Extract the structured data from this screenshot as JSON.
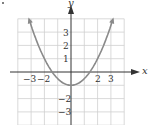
{
  "chart_data": {
    "type": "line",
    "title": "",
    "function": "y = x^2/2 - 1",
    "xlabel": "x",
    "ylabel": "y",
    "xlim": [
      -4,
      4
    ],
    "ylim": [
      -4,
      4
    ],
    "grid": true,
    "x_tick_labels": [
      "-3",
      "-2",
      "2",
      "3"
    ],
    "y_tick_labels": [
      "3",
      "2",
      "1",
      "-2",
      "-3"
    ],
    "series": [
      {
        "name": "parabola",
        "x": [
          -3.2,
          -3,
          -2,
          -1.41,
          -1,
          0,
          1,
          1.41,
          2,
          3,
          3.2
        ],
        "values": [
          4.12,
          3.5,
          1,
          0,
          -0.5,
          -1,
          -0.5,
          0,
          1,
          3.5,
          4.12
        ]
      }
    ],
    "colors": {
      "curve": "#888888",
      "grid": "#cccccc",
      "axis": "#333333"
    }
  },
  "labels": {
    "x_axis": "x",
    "y_axis": "y",
    "xt_m3": "−3",
    "xt_m2": "−2",
    "xt_2": "2",
    "xt_3": "3",
    "yt_3": "3",
    "yt_2": "2",
    "yt_1": "1",
    "yt_m2": "−2",
    "yt_m3": "−3"
  }
}
